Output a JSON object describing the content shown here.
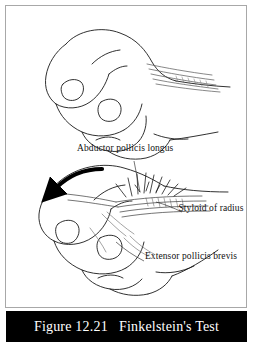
{
  "figure": {
    "caption": "Figure 12.21   Finkelstein's Test",
    "caption_bg": "#000000",
    "caption_color": "#ffffff",
    "border_color": "#a8a8a8",
    "background": "#ffffff",
    "line_color": "#1a1a1a"
  },
  "labels": {
    "abductor_pollicis_longus": "Abductor pollicis longus",
    "styloid_of_radius": "Styloid of radius",
    "extensor_pollicis_brevis": "Extensor pollicis brevis"
  },
  "panels": {
    "top": {
      "name": "neutral-fist",
      "description": "Closed fist with thumb tucked inside, wrist in neutral position, tendons extending along the dorsal forearm"
    },
    "bottom": {
      "name": "ulnar-deviated-fist",
      "description": "Same closed fist with wrist deviated toward the ulnar side, producing pain over the radial styloid",
      "arrow": "ulnar-deviation-arrow",
      "pain_marker": "radial-styloid-pain-starburst"
    }
  }
}
